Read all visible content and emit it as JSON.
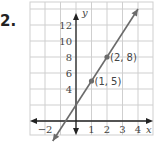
{
  "problem_number": "2.",
  "chart_data": {
    "type": "line",
    "title": "",
    "xlabel": "x",
    "ylabel": "y",
    "xlim": [
      -3,
      4.8
    ],
    "ylim": [
      -2,
      15
    ],
    "grid": true,
    "x_ticks": [
      "−2",
      "1",
      "2",
      "3",
      "4"
    ],
    "y_ticks": [
      "4",
      "6",
      "8",
      "10",
      "12"
    ],
    "series": [
      {
        "name": "line",
        "equation": "y = 3x + 2",
        "x": [
          -1.5,
          4
        ],
        "y": [
          -2.5,
          14
        ]
      }
    ],
    "points": [
      {
        "x": 1,
        "y": 5,
        "label": "(1, 5)"
      },
      {
        "x": 2,
        "y": 8,
        "label": "(2, 8)"
      }
    ],
    "colors": {
      "line": "#6b6b6b",
      "grid": "#cfcfcf",
      "axis": "#222222"
    }
  }
}
